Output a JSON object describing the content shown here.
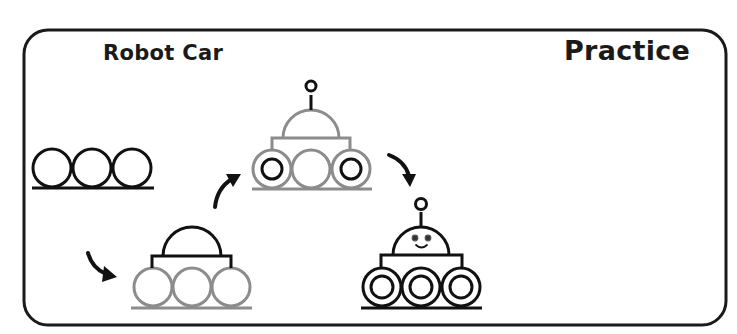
{
  "worksheet": {
    "title": "Robot Car",
    "mode_label": "Practice",
    "colors": {
      "ink": "#111111",
      "guide_gray": "#8c8c8c",
      "frame": "#1a1a1a",
      "background": "#ffffff"
    },
    "steps": [
      {
        "index": 1,
        "description": "Three wheels on a ground line",
        "color": "ink"
      },
      {
        "index": 2,
        "description": "Add body plate and dome (new parts black, previous gray)",
        "color": "ink"
      },
      {
        "index": 3,
        "description": "Add antenna and inner wheel rings",
        "color": "ink"
      },
      {
        "index": 4,
        "description": "Finished robot car with face",
        "color": "ink"
      }
    ],
    "arrows": [
      {
        "from": 1,
        "to": 2,
        "direction": "down-right"
      },
      {
        "from": 2,
        "to": 3,
        "direction": "up-right"
      },
      {
        "from": 3,
        "to": 4,
        "direction": "down-right"
      }
    ]
  }
}
